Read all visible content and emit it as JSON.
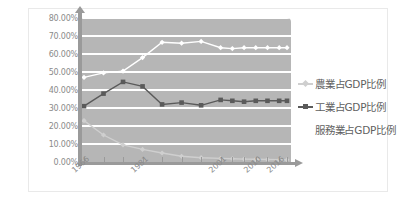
{
  "chart_data": {
    "type": "line",
    "title": "",
    "subtitle": "",
    "xlabel": "",
    "ylabel": "",
    "ylim": [
      0,
      80
    ],
    "ytick_labels": [
      "80.00%",
      "70.00%",
      "60.00%",
      "50.00%",
      "40.00%",
      "30.00%",
      "20.00%",
      "10.00%",
      "0.00%"
    ],
    "ytick_values": [
      80,
      70,
      60,
      50,
      40,
      30,
      20,
      10,
      0
    ],
    "grid": true,
    "legend_position": "right",
    "x": [
      1966,
      1971,
      1976,
      1981,
      1986,
      1991,
      1996,
      2001,
      2004,
      2007,
      2010,
      2013,
      2016,
      2018
    ],
    "xtick_labels": [
      "1966",
      "1981",
      "2001",
      "2010",
      "2016"
    ],
    "xtick_label_values": [
      1966,
      1981,
      2001,
      2010,
      2016
    ],
    "series": [
      {
        "name": "農業占GDP比例",
        "color": "#cfcfcf",
        "marker": "diamond",
        "values": [
          23.0,
          15.0,
          9.5,
          7.0,
          5.0,
          3.2,
          2.4,
          2.0,
          1.8,
          1.6,
          1.5,
          1.4,
          1.3,
          1.2
        ]
      },
      {
        "name": "工業占GDP比例",
        "color": "#5a5a5a",
        "marker": "square",
        "values": [
          31.0,
          38.0,
          44.5,
          42.0,
          32.0,
          33.0,
          31.5,
          34.5,
          34.0,
          33.5,
          34.0,
          34.0,
          34.0,
          34.0
        ]
      },
      {
        "name": "服務業占GDP比例",
        "color": "#ffffff",
        "marker": "diamond",
        "values": [
          47.0,
          49.5,
          50.5,
          58.0,
          66.5,
          66.0,
          67.0,
          63.5,
          63.0,
          63.5,
          63.5,
          63.5,
          63.5,
          63.5
        ]
      }
    ]
  },
  "legend": {
    "items": [
      {
        "label": "農業占GDP比例",
        "marker": "diamond-marker",
        "color": "#cfcfcf"
      },
      {
        "label": "工業占GDP比例",
        "marker": "square-marker",
        "color": "#5a5a5a"
      },
      {
        "label": "服務業占GDP比例",
        "marker": "none",
        "color": "#ffffff"
      }
    ]
  }
}
